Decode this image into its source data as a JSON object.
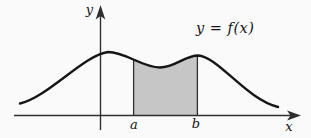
{
  "figure": {
    "equation_label": "y = f(x)",
    "y_axis_label": "y",
    "x_axis_label": "x",
    "lower_bound_label": "a",
    "upper_bound_label": "b"
  },
  "colors": {
    "background": "#fafafa",
    "curve": "#161616",
    "axis": "#2e2e2e",
    "shade_fill": "#c6c6c6"
  }
}
